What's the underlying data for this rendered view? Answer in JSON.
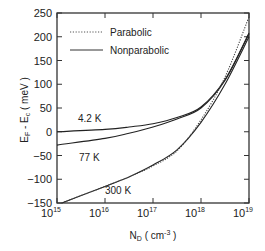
{
  "chart_data": {
    "type": "line",
    "title": "",
    "xlabel": "N_D ( cm^-3 )",
    "ylabel": "E_F - E_c ( meV )",
    "xscale": "log",
    "xlim": [
      1000000000000000.0,
      1e+19
    ],
    "ylim": [
      -150,
      250
    ],
    "x_ticks": [
      "10^15",
      "10^16",
      "10^17",
      "10^18",
      "10^19"
    ],
    "y_ticks": [
      250,
      200,
      150,
      100,
      50,
      0,
      -50,
      -100,
      -150
    ],
    "grid": false,
    "legend": {
      "position": "upper left",
      "entries": [
        {
          "label": "Parabolic",
          "style": "dotted"
        },
        {
          "label": "Nonparabolic",
          "style": "solid"
        }
      ]
    },
    "annotations": [
      "4.2 K",
      "77 K",
      "300 K"
    ],
    "series": [
      {
        "name": "4.2 K Nonparabolic",
        "style": "solid",
        "log10_x": [
          15,
          16,
          16.5,
          17,
          17.5,
          18,
          18.5,
          19
        ],
        "y": [
          0,
          5,
          10,
          17,
          30,
          52,
          110,
          208
        ]
      },
      {
        "name": "77 K Nonparabolic",
        "style": "solid",
        "log10_x": [
          15,
          16,
          16.5,
          17,
          17.5,
          18,
          18.5,
          19
        ],
        "y": [
          -28,
          -14,
          -3,
          10,
          27,
          50,
          108,
          206
        ]
      },
      {
        "name": "300 K Nonparabolic",
        "style": "solid",
        "log10_x": [
          15.1,
          16,
          16.5,
          17,
          17.5,
          18,
          18.5,
          19
        ],
        "y": [
          -150,
          -115,
          -95,
          -70,
          -38,
          20,
          100,
          200
        ]
      },
      {
        "name": "Parabolic",
        "style": "dotted",
        "log10_x": [
          15.1,
          16,
          16.5,
          17,
          17.5,
          18,
          18.5,
          19
        ],
        "y": [
          -150,
          -115,
          -95,
          -72,
          -40,
          25,
          115,
          242
        ]
      }
    ]
  },
  "labels": {
    "legend_parabolic": "Parabolic",
    "legend_nonparabolic": "Nonparabolic",
    "ann_42": "4.2 K",
    "ann_77": "77 K",
    "ann_300": "300 K",
    "ylabel_main": "E",
    "ylabel_sub1": "F",
    "ylabel_mid": " - E",
    "ylabel_sub2": "c",
    "ylabel_unit": " ( meV )",
    "xlabel_main": "N",
    "xlabel_sub": "D",
    "xlabel_unit": " ( cm",
    "xlabel_exp": "-3",
    "xlabel_close": " )"
  }
}
